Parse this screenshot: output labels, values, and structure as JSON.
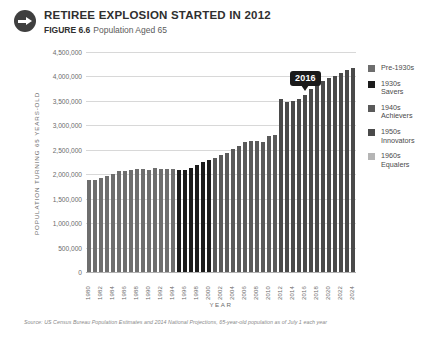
{
  "header": {
    "icon": "arrow-right-circle-icon",
    "title": "RETIREE EXPLOSION STARTED IN 2012",
    "figure_label": "FIGURE 6.6",
    "figure_desc": "Population Aged 65"
  },
  "annotation": {
    "label": "2016",
    "year": 2016
  },
  "legend": {
    "items": [
      {
        "label": "Pre-1930s",
        "color": "#6e6e6e"
      },
      {
        "label": "1930s\nSavers",
        "color": "#1c1c1c"
      },
      {
        "label": "1940s\nAchievers",
        "color": "#5a5a5a"
      },
      {
        "label": "1950s\nInnovators",
        "color": "#4a4a4a"
      },
      {
        "label": "1960s\nEqualers",
        "color": "#b5b5b5"
      }
    ]
  },
  "footnote": "Source: US Census Bureau Population Estimates and 2014 National Projections, 65-year-old population as of July 1 each year",
  "chart_data": {
    "type": "bar",
    "title": "RETIREE EXPLOSION STARTED IN 2012",
    "subtitle": "Population Aged 65",
    "xlabel": "YEAR",
    "ylabel": "POPULATION TURNING 65 YEARS-OLD",
    "ylim": [
      0,
      4500000
    ],
    "ytick_labels": [
      "4,500,000",
      "4,000,000",
      "3,500,000",
      "3,000,000",
      "2,500,000",
      "2,000,000",
      "1,500,000",
      "1,000,000",
      "500,000",
      "0"
    ],
    "ytick_values": [
      4500000,
      4000000,
      3500000,
      3000000,
      2500000,
      2000000,
      1500000,
      1000000,
      500000,
      0
    ],
    "grid": true,
    "legend_position": "right",
    "xtick_step": 2,
    "categories": [
      1980,
      1981,
      1982,
      1983,
      1984,
      1985,
      1986,
      1987,
      1988,
      1989,
      1990,
      1991,
      1992,
      1993,
      1994,
      1995,
      1996,
      1997,
      1998,
      1999,
      2000,
      2001,
      2002,
      2003,
      2004,
      2005,
      2006,
      2007,
      2008,
      2009,
      2010,
      2011,
      2012,
      2013,
      2014,
      2015,
      2016,
      2017,
      2018,
      2019,
      2020,
      2021,
      2022,
      2023,
      2024
    ],
    "values": [
      1880000,
      1880000,
      1930000,
      1960000,
      2000000,
      2060000,
      2070000,
      2080000,
      2110000,
      2100000,
      2090000,
      2120000,
      2110000,
      2110000,
      2110000,
      2080000,
      2080000,
      2120000,
      2180000,
      2260000,
      2300000,
      2330000,
      2390000,
      2430000,
      2510000,
      2580000,
      2660000,
      2690000,
      2690000,
      2650000,
      2780000,
      2800000,
      3530000,
      3480000,
      3490000,
      3540000,
      3630000,
      3740000,
      3840000,
      3910000,
      3960000,
      4010000,
      4070000,
      4140000,
      4180000
    ],
    "bar_colors": [
      "#6e6e6e",
      "#6e6e6e",
      "#6e6e6e",
      "#6e6e6e",
      "#6e6e6e",
      "#6e6e6e",
      "#6e6e6e",
      "#6e6e6e",
      "#6e6e6e",
      "#6e6e6e",
      "#6e6e6e",
      "#6e6e6e",
      "#6e6e6e",
      "#6e6e6e",
      "#6e6e6e",
      "#1c1c1c",
      "#1c1c1c",
      "#1c1c1c",
      "#1c1c1c",
      "#1c1c1c",
      "#1c1c1c",
      "#5a5a5a",
      "#5a5a5a",
      "#5a5a5a",
      "#5a5a5a",
      "#5a5a5a",
      "#5a5a5a",
      "#5a5a5a",
      "#5a5a5a",
      "#5a5a5a",
      "#5a5a5a",
      "#5a5a5a",
      "#4a4a4a",
      "#4a4a4a",
      "#4a4a4a",
      "#4a4a4a",
      "#4a4a4a",
      "#4a4a4a",
      "#4a4a4a",
      "#4a4a4a",
      "#4a4a4a",
      "#4a4a4a",
      "#4a4a4a",
      "#4a4a4a",
      "#4a4a4a"
    ]
  }
}
